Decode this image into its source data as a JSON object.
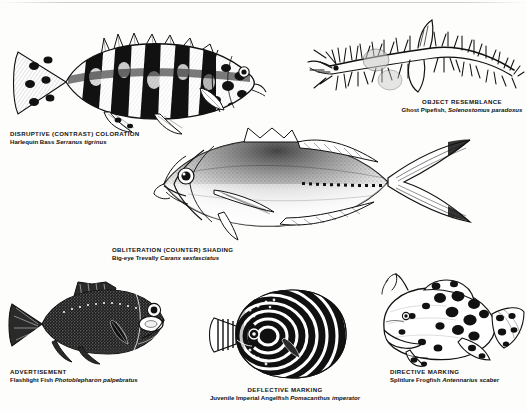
{
  "plate": {
    "background_color": "#fdfdfb",
    "ink_color": "#111111",
    "medium": "pen-and-ink scientific illustration"
  },
  "figures": [
    {
      "id": "harlequin-bass",
      "strategy": "DISRUPTIVE (CONTRAST) COLORATION",
      "common_name": "Harlequin Bass",
      "species": "Serranus tigrinus",
      "position": "top-left",
      "orientation": "head-right",
      "pattern": "bold black vertical bars and blotches with spotted fins"
    },
    {
      "id": "ghost-pipefish",
      "strategy": "OBJECT RESEMBLANCE",
      "common_name": "Ghost Pipefish",
      "species": "Solenostomus paradoxus",
      "position": "top-right",
      "orientation": "diagonal",
      "pattern": "spiky branching dermal appendages resembling algae"
    },
    {
      "id": "big-eye-trevally",
      "strategy": "OBLITERATION (COUNTER) SHADING",
      "common_name": "Big-eye Trevally",
      "species": "Caranx sexfasciatus",
      "position": "center",
      "orientation": "head-left",
      "pattern": "dark stippled dorsal grading to pale ventral, forked tail"
    },
    {
      "id": "flashlight-fish",
      "strategy": "ADVERTISEMENT",
      "common_name": "Flashlight Fish",
      "species": "Photoblepharon palpebratus",
      "position": "bottom-left",
      "orientation": "head-right",
      "pattern": "near-black body with bright white sub-ocular light organ"
    },
    {
      "id": "imperial-angelfish",
      "strategy": "DEFLECTIVE MARKING",
      "common_name": "Juvenile Imperial Angelfish",
      "species": "Pomacanthus imperator",
      "position": "bottom-center",
      "orientation": "head-left",
      "pattern": "concentric white rings on black disc-shaped body"
    },
    {
      "id": "splitlure-frogfish",
      "strategy": "DIRECTIVE MARKING",
      "common_name": "Splitlure Frogfish",
      "species": "Antennarius scaber",
      "position": "bottom-right",
      "orientation": "head-left",
      "pattern": "lumpy body with bold black ocellated spots and raised lure"
    }
  ],
  "captions": {
    "bass": {
      "title": "DISRUPTIVE (CONTRAST) COLORATION",
      "common": "Harlequin Bass ",
      "sci": "Serranus tigrinus"
    },
    "pipefish": {
      "title": "OBJECT RESEMBLANCE",
      "common": "Ghost Pipefish, ",
      "sci": "Solenostomus paradoxus"
    },
    "trevally": {
      "title": "OBLITERATION (COUNTER) SHADING",
      "common": "Big-eye Trevally ",
      "sci": "Caranx sexfasciatus"
    },
    "flashlight": {
      "title": "ADVERTISEMENT",
      "common": "Flashlight Fish ",
      "sci": "Photoblepharon palpebratus"
    },
    "angelfish": {
      "title": "DEFLECTIVE MARKING",
      "common": "Juvenile Imperial Angelfish ",
      "sci": "Pomacanthus imperator"
    },
    "frogfish": {
      "title": "DIRECTIVE MARKING",
      "common": "Splitlure Frogfish ",
      "sci": "Antennarius scaber"
    }
  }
}
